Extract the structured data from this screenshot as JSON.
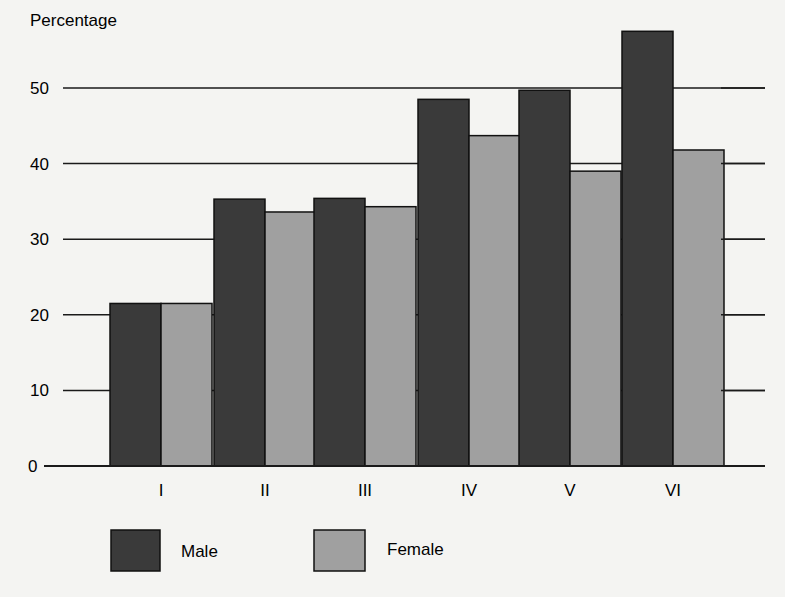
{
  "chart_data": {
    "type": "bar",
    "title": "",
    "xlabel": "",
    "ylabel": "Percentage",
    "ylim": [
      0,
      58
    ],
    "yticks": [
      0,
      10,
      20,
      30,
      40,
      50
    ],
    "grid": true,
    "legend_position": "bottom-left",
    "categories": [
      "I",
      "II",
      "III",
      "IV",
      "V",
      "VI"
    ],
    "series": [
      {
        "name": "Male",
        "color": "#3a3a3a",
        "values": [
          21.5,
          35.3,
          35.4,
          48.5,
          49.7,
          57.5
        ]
      },
      {
        "name": "Female",
        "color": "#a0a0a0",
        "values": [
          21.5,
          33.6,
          34.3,
          43.7,
          39.0,
          41.8
        ]
      }
    ]
  },
  "labels": {
    "ylabel": "Percentage",
    "legend_male": "Male",
    "legend_female": "Female"
  },
  "colors": {
    "male": "#3a3a3a",
    "female": "#a0a0a0",
    "axis": "#1a1a1a",
    "background": "#f4f4f2"
  }
}
